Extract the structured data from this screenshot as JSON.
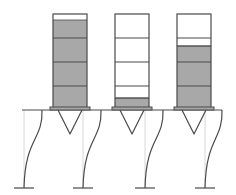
{
  "diagram": {
    "colors": {
      "outline": "#4a4a4a",
      "fill_gray": "#a8a8a8",
      "fill_white": "#ffffff",
      "guide": "#d8d8d8",
      "background": "#ffffff"
    },
    "containers": [
      {
        "id": "container-1",
        "x": 53,
        "width": 34,
        "top": 14,
        "bottom": 108,
        "fill_from_y": 20,
        "dividers": [
          38,
          62,
          86
        ],
        "fill_level_label": "nearly full"
      },
      {
        "id": "container-2",
        "x": 115,
        "width": 34,
        "top": 14,
        "bottom": 108,
        "fill_from_y": 98,
        "dividers": [
          38,
          62,
          86,
          98
        ],
        "fill_level_label": "nearly empty"
      },
      {
        "id": "container-3",
        "x": 177,
        "width": 34,
        "top": 14,
        "bottom": 108,
        "fill_from_y": 46,
        "dividers": [
          38,
          46,
          62,
          86
        ],
        "fill_level_label": "partially full"
      }
    ],
    "platform": {
      "x1": 22,
      "x2": 222,
      "y": 110
    },
    "columns": [
      {
        "top_x": 42,
        "bottom_x": 24
      },
      {
        "top_x": 101,
        "bottom_x": 83
      },
      {
        "top_x": 163,
        "bottom_x": 145
      },
      {
        "top_x": 222,
        "bottom_x": 205
      }
    ],
    "ground_y": 188,
    "guides_x": [
      24,
      83,
      145,
      205
    ]
  }
}
